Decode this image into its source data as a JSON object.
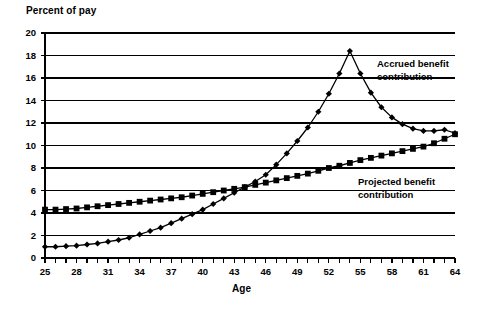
{
  "chart_data": {
    "type": "line",
    "title": "",
    "ylabel": "Percent of pay",
    "xlabel": "Age",
    "xlim": [
      25,
      64
    ],
    "ylim": [
      0,
      20
    ],
    "ytick_step": 2,
    "xtick_step": 3,
    "grid": true,
    "legend_position": "inline-annotation",
    "yticks": [
      "0",
      "2",
      "4",
      "6",
      "8",
      "10",
      "12",
      "14",
      "16",
      "18",
      "20"
    ],
    "xticks": [
      "25",
      "28",
      "31",
      "34",
      "37",
      "40",
      "43",
      "46",
      "49",
      "52",
      "55",
      "58",
      "61",
      "64"
    ],
    "x": [
      25,
      26,
      27,
      28,
      29,
      30,
      31,
      32,
      33,
      34,
      35,
      36,
      37,
      38,
      39,
      40,
      41,
      42,
      43,
      44,
      45,
      46,
      47,
      48,
      49,
      50,
      51,
      52,
      53,
      54,
      55,
      56,
      57,
      58,
      59,
      60,
      61,
      62,
      63,
      64
    ],
    "series": [
      {
        "name": "Accrued benefit contribution",
        "marker": "diamond",
        "color": "#000000",
        "values": [
          1.0,
          1.0,
          1.05,
          1.1,
          1.2,
          1.3,
          1.45,
          1.6,
          1.8,
          2.1,
          2.4,
          2.7,
          3.1,
          3.5,
          3.9,
          4.3,
          4.8,
          5.3,
          5.8,
          6.3,
          6.8,
          7.4,
          8.3,
          9.3,
          10.4,
          11.6,
          13.0,
          14.6,
          16.4,
          18.4,
          16.4,
          14.7,
          13.4,
          12.5,
          11.9,
          11.5,
          11.3,
          11.3,
          11.4,
          11.1
        ]
      },
      {
        "name": "Projected benefit contribution",
        "marker": "square",
        "color": "#000000",
        "values": [
          4.3,
          4.3,
          4.35,
          4.4,
          4.5,
          4.6,
          4.7,
          4.8,
          4.9,
          5.0,
          5.1,
          5.2,
          5.3,
          5.4,
          5.55,
          5.7,
          5.85,
          6.0,
          6.15,
          6.3,
          6.5,
          6.7,
          6.9,
          7.1,
          7.3,
          7.5,
          7.75,
          8.0,
          8.2,
          8.45,
          8.7,
          8.9,
          9.1,
          9.3,
          9.5,
          9.7,
          9.9,
          10.2,
          10.6,
          11.0
        ]
      }
    ],
    "annotations": [
      {
        "id": "accrued",
        "line1": "Accrued benefit",
        "line2": "contribution"
      },
      {
        "id": "projected",
        "line1": "Projected benefit",
        "line2": "contribution"
      }
    ]
  }
}
